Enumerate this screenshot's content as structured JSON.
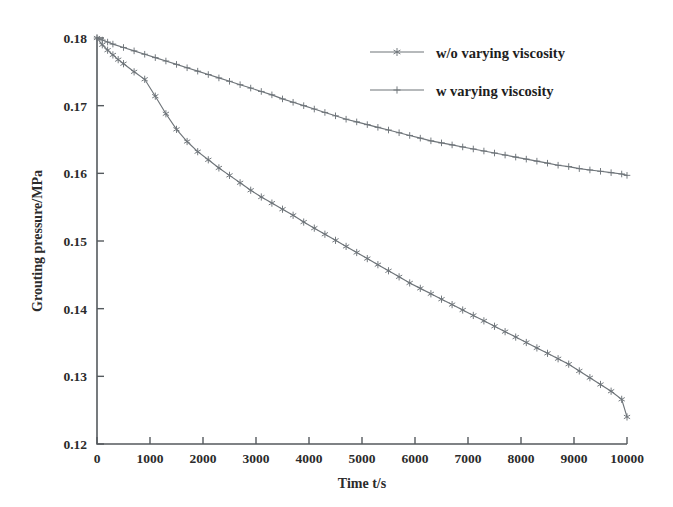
{
  "chart_data": {
    "type": "line",
    "title": "",
    "xlabel": "Time t/s",
    "ylabel": "Grouting pressure/MPa",
    "xlim": [
      0,
      10000
    ],
    "ylim": [
      0.12,
      0.18
    ],
    "xticks": [
      0,
      1000,
      2000,
      3000,
      4000,
      5000,
      6000,
      7000,
      8000,
      9000,
      10000
    ],
    "xticklabels": [
      "0",
      "1000",
      "2000",
      "3000",
      "4000",
      "5000",
      "6000",
      "7000",
      "8000",
      "9000",
      "10000"
    ],
    "yticks": [
      0.12,
      0.13,
      0.14,
      0.15,
      0.16,
      0.17,
      0.18
    ],
    "yticklabels": [
      "0.12",
      "0.13",
      "0.14",
      "0.15",
      "0.16",
      "0.17",
      "0.18"
    ],
    "grid": false,
    "legend_position": "upper right",
    "series": [
      {
        "name": "w/o varying viscosity",
        "marker": "hexagram",
        "color": "#6e7479",
        "x": [
          0,
          100,
          200,
          300,
          400,
          500,
          700,
          900,
          1100,
          1300,
          1500,
          1700,
          1900,
          2100,
          2300,
          2500,
          2700,
          2900,
          3100,
          3300,
          3500,
          3700,
          3900,
          4100,
          4300,
          4500,
          4700,
          4900,
          5100,
          5300,
          5500,
          5700,
          5900,
          6100,
          6300,
          6500,
          6700,
          6900,
          7100,
          7300,
          7500,
          7700,
          7900,
          8100,
          8300,
          8500,
          8700,
          8900,
          9100,
          9300,
          9500,
          9700,
          9900,
          10000
        ],
        "y": [
          0.18,
          0.179,
          0.1782,
          0.1775,
          0.1768,
          0.1762,
          0.175,
          0.1739,
          0.1714,
          0.1688,
          0.1665,
          0.1647,
          0.1632,
          0.162,
          0.1608,
          0.1597,
          0.1586,
          0.1575,
          0.1565,
          0.1556,
          0.1547,
          0.1538,
          0.1528,
          0.1519,
          0.151,
          0.1501,
          0.1492,
          0.1483,
          0.1474,
          0.1465,
          0.1456,
          0.1447,
          0.1438,
          0.143,
          0.1422,
          0.1414,
          0.1406,
          0.1398,
          0.139,
          0.1382,
          0.1374,
          0.1366,
          0.1358,
          0.135,
          0.1342,
          0.1334,
          0.1326,
          0.1318,
          0.1308,
          0.1298,
          0.1288,
          0.1278,
          0.1266,
          0.124
        ]
      },
      {
        "name": "w varying viscosity",
        "marker": "plus",
        "color": "#6e7479",
        "x": [
          0,
          100,
          200,
          300,
          500,
          700,
          900,
          1100,
          1300,
          1500,
          1700,
          1900,
          2100,
          2300,
          2500,
          2700,
          2900,
          3100,
          3300,
          3500,
          3700,
          3900,
          4100,
          4300,
          4500,
          4700,
          4900,
          5100,
          5300,
          5500,
          5700,
          5900,
          6100,
          6300,
          6500,
          6700,
          6900,
          7100,
          7300,
          7500,
          7700,
          7900,
          8100,
          8300,
          8500,
          8700,
          8900,
          9100,
          9300,
          9500,
          9700,
          9900,
          10000
        ],
        "y": [
          0.18,
          0.1797,
          0.1794,
          0.1791,
          0.1786,
          0.1781,
          0.1776,
          0.1771,
          0.1766,
          0.1761,
          0.1756,
          0.1751,
          0.1746,
          0.1741,
          0.1736,
          0.1731,
          0.1726,
          0.1721,
          0.1716,
          0.171,
          0.1705,
          0.17,
          0.1695,
          0.169,
          0.1685,
          0.168,
          0.1676,
          0.1672,
          0.1668,
          0.1664,
          0.166,
          0.1656,
          0.1652,
          0.1648,
          0.1645,
          0.1642,
          0.1639,
          0.1636,
          0.1633,
          0.163,
          0.1627,
          0.1624,
          0.1621,
          0.1618,
          0.1615,
          0.1612,
          0.161,
          0.1607,
          0.1605,
          0.1603,
          0.1601,
          0.1599,
          0.1597
        ]
      }
    ]
  },
  "legend": {
    "items": [
      {
        "label": "w/o varying viscosity"
      },
      {
        "label": "w varying viscosity"
      }
    ]
  }
}
